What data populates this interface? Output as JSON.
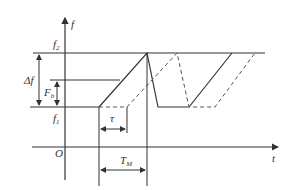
{
  "diagram": {
    "title": "",
    "axes": {
      "y_label": "f",
      "x_label": "t",
      "origin_label": "O"
    },
    "levels": {
      "f2": {
        "label": "f",
        "sub": "2"
      },
      "f1": {
        "label": "f",
        "sub": "1"
      }
    },
    "dimensions": {
      "delta_f": {
        "label": "Δf"
      },
      "F_b": {
        "label": "F",
        "sub": "b"
      },
      "tau": {
        "label": "τ"
      },
      "T_M": {
        "label": "T",
        "sub": "M"
      }
    },
    "series": [
      {
        "name": "transmitted",
        "style": "solid"
      },
      {
        "name": "delayed",
        "style": "dashed"
      }
    ],
    "colors": {
      "line": "#333333"
    }
  }
}
